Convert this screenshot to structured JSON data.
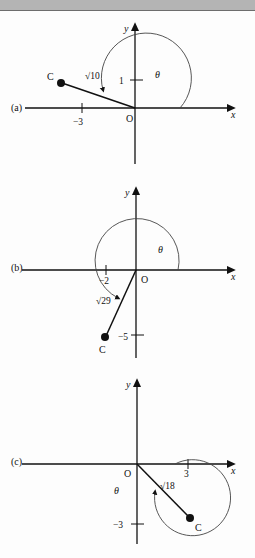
{
  "page": {
    "background_color": "#fdfdfd",
    "top_band_color": "#b4b4b4",
    "top_band_rule_color": "#6d6d6d",
    "ink_color": "#111111"
  },
  "figures": [
    {
      "label": "(a)",
      "axis_x_label": "x",
      "axis_y_label": "y",
      "origin_label": "O",
      "point_label": "C",
      "radius_label": "√10",
      "angle_label": "θ",
      "x_tick_label": "−3",
      "y_tick_label": "1",
      "point": {
        "x": -3,
        "y": 1
      },
      "radius_value": "√10",
      "angle_quadrant": "second"
    },
    {
      "label": "(b)",
      "axis_x_label": "x",
      "axis_y_label": "y",
      "origin_label": "O",
      "point_label": "C",
      "radius_label": "√29",
      "angle_label": "θ",
      "x_tick_label": "−2",
      "y_tick_label": "−5",
      "point": {
        "x": -2,
        "y": -5
      },
      "radius_value": "√29",
      "angle_quadrant": "third"
    },
    {
      "label": "(c)",
      "axis_x_label": "x",
      "axis_y_label": "y",
      "origin_label": "O",
      "point_label": "C",
      "radius_label": "√18",
      "angle_label": "θ",
      "x_tick_label": "3",
      "y_tick_label": "−3",
      "point": {
        "x": 3,
        "y": -3
      },
      "radius_value": "√18",
      "angle_quadrant": "fourth"
    }
  ]
}
